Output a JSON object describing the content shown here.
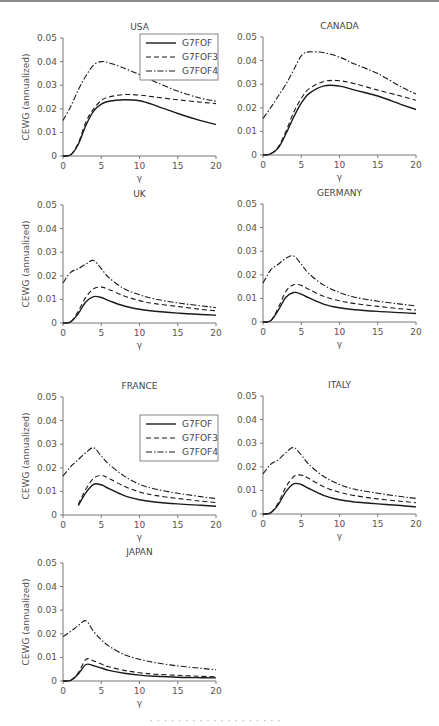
{
  "figure": {
    "caption_fragment": "· · · · · ·   · · · ·   · · · ·   · · · · ·"
  },
  "chart_data": [
    {
      "type": "line",
      "title": "USA",
      "xlabel": "γ",
      "ylabel": "CEWG (annualized)",
      "xlim": [
        0,
        20
      ],
      "ylim": [
        0,
        0.05
      ],
      "xticks": [
        0,
        5,
        10,
        15,
        20
      ],
      "yticks": [
        0,
        0.01,
        0.02,
        0.03,
        0.04,
        0.05
      ],
      "legend": true,
      "legend_position": "upper right",
      "x": [
        0,
        1,
        2,
        3,
        4,
        5,
        6,
        8,
        10,
        12,
        15,
        18,
        20
      ],
      "series": [
        {
          "name": "G7FOF",
          "style": "solid",
          "values": [
            0,
            0.0005,
            0.005,
            0.013,
            0.019,
            0.022,
            0.0232,
            0.0238,
            0.0234,
            0.0215,
            0.018,
            0.015,
            0.0133
          ]
        },
        {
          "name": "G7FOF3",
          "style": "dashed",
          "values": [
            0,
            0.0005,
            0.0055,
            0.0145,
            0.02,
            0.0235,
            0.025,
            0.026,
            0.0258,
            0.025,
            0.0238,
            0.0228,
            0.0222
          ]
        },
        {
          "name": "G7FOF4",
          "style": "dashdot",
          "values": [
            0.015,
            0.021,
            0.028,
            0.034,
            0.0385,
            0.04,
            0.0395,
            0.0372,
            0.0345,
            0.0315,
            0.0275,
            0.0245,
            0.0232
          ]
        }
      ]
    },
    {
      "type": "line",
      "title": "CANADA",
      "xlabel": "γ",
      "ylabel": "",
      "xlim": [
        0,
        20
      ],
      "ylim": [
        0,
        0.05
      ],
      "xticks": [
        0,
        5,
        10,
        15,
        20
      ],
      "yticks": [
        0,
        0.01,
        0.02,
        0.03,
        0.04,
        0.05
      ],
      "legend": false,
      "x": [
        0,
        1,
        2,
        3,
        4,
        5,
        6,
        8,
        10,
        12,
        15,
        18,
        20
      ],
      "series": [
        {
          "name": "G7FOF",
          "style": "solid",
          "values": [
            0,
            0.0005,
            0.003,
            0.009,
            0.016,
            0.022,
            0.026,
            0.0293,
            0.0292,
            0.0275,
            0.025,
            0.0215,
            0.0193
          ]
        },
        {
          "name": "G7FOF3",
          "style": "dashed",
          "values": [
            0,
            0.0005,
            0.0035,
            0.01,
            0.018,
            0.024,
            0.028,
            0.0312,
            0.0315,
            0.0302,
            0.0275,
            0.025,
            0.0232
          ]
        },
        {
          "name": "G7FOF4",
          "style": "dashdot",
          "values": [
            0.0155,
            0.02,
            0.025,
            0.03,
            0.036,
            0.042,
            0.0437,
            0.0433,
            0.0415,
            0.0385,
            0.0345,
            0.029,
            0.0258
          ]
        }
      ]
    },
    {
      "type": "line",
      "title": "UK",
      "xlabel": "γ",
      "ylabel": "CEWG (annualized)",
      "xlim": [
        0,
        20
      ],
      "ylim": [
        0,
        0.05
      ],
      "xticks": [
        0,
        5,
        10,
        15,
        20
      ],
      "yticks": [
        0,
        0.01,
        0.02,
        0.03,
        0.04,
        0.05
      ],
      "legend": false,
      "x": [
        0,
        1,
        2,
        3,
        4,
        5,
        6,
        8,
        10,
        12,
        15,
        18,
        20
      ],
      "series": [
        {
          "name": "G7FOF",
          "style": "solid",
          "values": [
            0,
            0.0005,
            0.004,
            0.009,
            0.0112,
            0.0108,
            0.0095,
            0.0072,
            0.0058,
            0.005,
            0.0042,
            0.0036,
            0.0033
          ]
        },
        {
          "name": "G7FOF3",
          "style": "dashed",
          "values": [
            0,
            0.0005,
            0.005,
            0.011,
            0.0145,
            0.0152,
            0.0142,
            0.0115,
            0.0095,
            0.0082,
            0.007,
            0.0058,
            0.0052
          ]
        },
        {
          "name": "G7FOF4",
          "style": "dashdot",
          "values": [
            0.017,
            0.0215,
            0.023,
            0.025,
            0.0265,
            0.023,
            0.0192,
            0.0145,
            0.012,
            0.0102,
            0.0085,
            0.0073,
            0.0065
          ]
        }
      ]
    },
    {
      "type": "line",
      "title": "GERMANY",
      "xlabel": "γ",
      "ylabel": "",
      "xlim": [
        0,
        20
      ],
      "ylim": [
        0,
        0.05
      ],
      "xticks": [
        0,
        5,
        10,
        15,
        20
      ],
      "yticks": [
        0,
        0.01,
        0.02,
        0.03,
        0.04,
        0.05
      ],
      "legend": false,
      "x": [
        0,
        1,
        2,
        3,
        4,
        5,
        6,
        8,
        10,
        12,
        15,
        18,
        20
      ],
      "series": [
        {
          "name": "G7FOF",
          "style": "solid",
          "values": [
            0,
            0.0005,
            0.005,
            0.0105,
            0.0125,
            0.0118,
            0.0102,
            0.0075,
            0.006,
            0.0052,
            0.0045,
            0.004,
            0.0036
          ]
        },
        {
          "name": "G7FOF3",
          "style": "dashed",
          "values": [
            0,
            0.0005,
            0.006,
            0.013,
            0.0158,
            0.0155,
            0.0138,
            0.0108,
            0.009,
            0.0078,
            0.0066,
            0.0056,
            0.0051
          ]
        },
        {
          "name": "G7FOF4",
          "style": "dashdot",
          "values": [
            0.0165,
            0.022,
            0.0245,
            0.027,
            0.028,
            0.0245,
            0.0205,
            0.0155,
            0.0125,
            0.0105,
            0.0088,
            0.0076,
            0.0068
          ]
        }
      ]
    },
    {
      "type": "line",
      "title": "FRANCE",
      "xlabel": "γ",
      "ylabel": "CEWG (annualized)",
      "xlim": [
        0,
        20
      ],
      "ylim": [
        0,
        0.05
      ],
      "xticks": [
        0,
        5,
        10,
        15,
        20
      ],
      "yticks": [
        0,
        0.01,
        0.02,
        0.03,
        0.04,
        0.05
      ],
      "legend": true,
      "legend_position": "upper right",
      "x": [
        0,
        1,
        2,
        3,
        4,
        5,
        6,
        8,
        10,
        12,
        15,
        18,
        20
      ],
      "series": [
        {
          "name": "G7FOF",
          "style": "solid",
          "values": [
            null,
            null,
            0.004,
            0.0095,
            0.013,
            0.0128,
            0.0112,
            0.0082,
            0.0065,
            0.0055,
            0.0047,
            0.0041,
            0.0037
          ]
        },
        {
          "name": "G7FOF3",
          "style": "dashed",
          "values": [
            null,
            null,
            0.0045,
            0.011,
            0.0155,
            0.0168,
            0.0155,
            0.0122,
            0.0098,
            0.0083,
            0.007,
            0.0059,
            0.0053
          ]
        },
        {
          "name": "G7FOF4",
          "style": "dashdot",
          "values": [
            0.0165,
            0.0205,
            0.0235,
            0.0265,
            0.0285,
            0.025,
            0.0215,
            0.0165,
            0.013,
            0.011,
            0.0092,
            0.0078,
            0.007
          ]
        }
      ]
    },
    {
      "type": "line",
      "title": "ITALY",
      "xlabel": "γ",
      "ylabel": "",
      "xlim": [
        0,
        20
      ],
      "ylim": [
        0,
        0.05
      ],
      "xticks": [
        0,
        5,
        10,
        15,
        20
      ],
      "yticks": [
        0,
        0.01,
        0.02,
        0.03,
        0.04,
        0.05
      ],
      "legend": false,
      "x": [
        0,
        1,
        2,
        3,
        4,
        5,
        6,
        8,
        10,
        12,
        15,
        18,
        20
      ],
      "series": [
        {
          "name": "G7FOF",
          "style": "solid",
          "values": [
            0,
            0.0005,
            0.004,
            0.0095,
            0.0128,
            0.0125,
            0.0108,
            0.0078,
            0.006,
            0.0051,
            0.0043,
            0.0036,
            0.003
          ]
        },
        {
          "name": "G7FOF3",
          "style": "dashed",
          "values": [
            0,
            0.0005,
            0.0048,
            0.0115,
            0.0158,
            0.0165,
            0.015,
            0.0115,
            0.0092,
            0.0078,
            0.0064,
            0.0054,
            0.0048
          ]
        },
        {
          "name": "G7FOF4",
          "style": "dashdot",
          "values": [
            0.017,
            0.021,
            0.023,
            0.026,
            0.0282,
            0.025,
            0.021,
            0.0158,
            0.0125,
            0.0105,
            0.0088,
            0.0074,
            0.0066
          ]
        }
      ]
    },
    {
      "type": "line",
      "title": "JAPAN",
      "xlabel": "γ",
      "ylabel": "CEWG (annualized)",
      "xlim": [
        0,
        20
      ],
      "ylim": [
        0,
        0.05
      ],
      "xticks": [
        0,
        5,
        10,
        15,
        20
      ],
      "yticks": [
        0,
        0.01,
        0.02,
        0.03,
        0.04,
        0.05
      ],
      "legend": false,
      "x": [
        0,
        1,
        2,
        3,
        4,
        5,
        6,
        8,
        10,
        12,
        15,
        18,
        20
      ],
      "series": [
        {
          "name": "G7FOF",
          "style": "solid",
          "values": [
            0,
            0.0003,
            0.003,
            0.007,
            0.0065,
            0.0055,
            0.0045,
            0.0033,
            0.0025,
            0.002,
            0.0016,
            0.0014,
            0.0013
          ]
        },
        {
          "name": "G7FOF3",
          "style": "dashed",
          "values": [
            0,
            0.0003,
            0.0035,
            0.0092,
            0.0085,
            0.0072,
            0.006,
            0.0045,
            0.0035,
            0.0029,
            0.0024,
            0.002,
            0.0018
          ]
        },
        {
          "name": "G7FOF4",
          "style": "dashdot",
          "values": [
            0.0188,
            0.021,
            0.0235,
            0.0255,
            0.021,
            0.0175,
            0.0148,
            0.0112,
            0.0092,
            0.0078,
            0.0064,
            0.0054,
            0.0048
          ]
        }
      ]
    }
  ],
  "layout": {
    "panels": [
      {
        "x0": 63,
        "y0": 156,
        "w": 153,
        "h": 118
      },
      {
        "x0": 263,
        "y0": 155,
        "w": 153,
        "h": 118
      },
      {
        "x0": 63,
        "y0": 323,
        "w": 153,
        "h": 118
      },
      {
        "x0": 263,
        "y0": 322,
        "w": 153,
        "h": 118
      },
      {
        "x0": 63,
        "y0": 515,
        "w": 153,
        "h": 118
      },
      {
        "x0": 263,
        "y0": 514,
        "w": 153,
        "h": 118
      },
      {
        "x0": 63,
        "y0": 681,
        "w": 153,
        "h": 118
      }
    ],
    "line_color": "#1a1a1a",
    "axis_color": "#777777"
  }
}
